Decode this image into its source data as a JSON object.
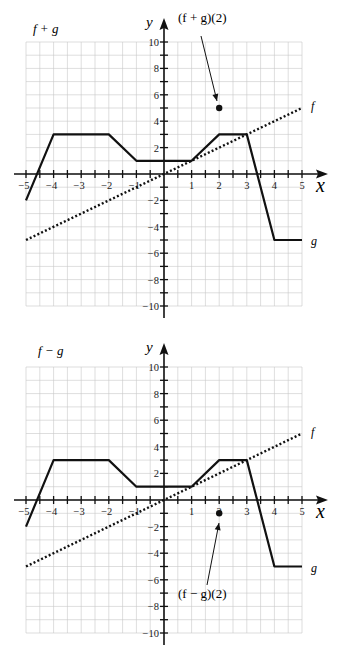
{
  "chart_data": [
    {
      "type": "line",
      "title": "f + g",
      "xlabel": "x",
      "ylabel": "y",
      "xlim": [
        -5,
        5
      ],
      "ylim": [
        -10,
        10
      ],
      "grid": true,
      "x_ticks": [
        -5,
        -4,
        -3,
        -2,
        -1,
        1,
        2,
        3,
        4,
        5
      ],
      "y_ticks": [
        -10,
        -8,
        -6,
        -4,
        -2,
        2,
        4,
        6,
        8,
        10
      ],
      "series": [
        {
          "name": "f",
          "style": "dotted",
          "points": [
            [
              -5,
              -5
            ],
            [
              5,
              5
            ]
          ]
        },
        {
          "name": "g",
          "style": "solid",
          "points": [
            [
              -5,
              -2
            ],
            [
              -4,
              3
            ],
            [
              -2,
              3
            ],
            [
              -1,
              1
            ],
            [
              1,
              1
            ],
            [
              2,
              3
            ],
            [
              3,
              3
            ],
            [
              4,
              -5
            ],
            [
              5,
              -5
            ]
          ]
        }
      ],
      "highlight_point": {
        "label": "(f + g)(2)",
        "x": 2,
        "y": 5
      },
      "annotations": [
        "(f + g)(2)",
        "f",
        "g"
      ]
    },
    {
      "type": "line",
      "title": "f − g",
      "xlabel": "x",
      "ylabel": "y",
      "xlim": [
        -5,
        5
      ],
      "ylim": [
        -10,
        10
      ],
      "grid": true,
      "x_ticks": [
        -5,
        -4,
        -3,
        -2,
        -1,
        1,
        2,
        3,
        4,
        5
      ],
      "y_ticks": [
        -10,
        -8,
        -6,
        -4,
        -2,
        2,
        4,
        6,
        8,
        10
      ],
      "series": [
        {
          "name": "f",
          "style": "dotted",
          "points": [
            [
              -5,
              -5
            ],
            [
              5,
              5
            ]
          ]
        },
        {
          "name": "g",
          "style": "solid",
          "points": [
            [
              -5,
              -2
            ],
            [
              -4,
              3
            ],
            [
              -2,
              3
            ],
            [
              -1,
              1
            ],
            [
              1,
              1
            ],
            [
              2,
              3
            ],
            [
              3,
              3
            ],
            [
              4,
              -5
            ],
            [
              5,
              -5
            ]
          ]
        }
      ],
      "highlight_point": {
        "label": "(f − g)(2)",
        "x": 2,
        "y": -1
      },
      "annotations": [
        "(f − g)(2)",
        "f",
        "g"
      ]
    }
  ],
  "top": {
    "title": "f + g",
    "point_label": "(f + g)(2)",
    "f_label": "f",
    "g_label": "g",
    "x_label": "x",
    "y_label": "y"
  },
  "bottom": {
    "title": "f − g",
    "point_label": "(f − g)(2)",
    "f_label": "f",
    "g_label": "g",
    "x_label": "x",
    "y_label": "y"
  }
}
